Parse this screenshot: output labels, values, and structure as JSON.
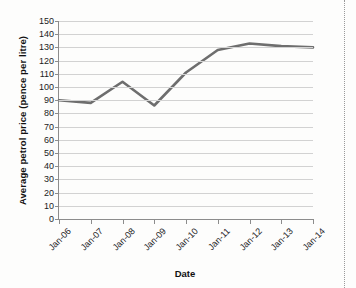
{
  "page": {
    "background_color": "#fdfdfc",
    "fold_marker": "dotted-vertical-rule"
  },
  "chart_data": {
    "type": "line",
    "title": "",
    "subtitle": "",
    "xlabel": "Date",
    "ylabel": "Average petrol price (pence per litre)",
    "categories": [
      "Jan-06",
      "Jan-07",
      "Jan-08",
      "Jan-09",
      "Jan-10",
      "Jan-11",
      "Jan-12",
      "Jan-13",
      "Jan-14"
    ],
    "values": [
      90,
      88,
      104,
      86,
      111,
      128,
      133,
      131,
      130
    ],
    "series": [
      {
        "name": "Average petrol price",
        "values": [
          90,
          88,
          104,
          86,
          111,
          128,
          133,
          131,
          130
        ],
        "color": "#6e6e6e",
        "line_width": 2.6,
        "markers": false
      }
    ],
    "ylim": [
      0,
      150
    ],
    "ytick_step": 10,
    "ytick_labels": [
      "0",
      "10",
      "20",
      "30",
      "40",
      "50",
      "60",
      "70",
      "80",
      "90",
      "100",
      "110",
      "120",
      "130",
      "140",
      "150"
    ],
    "xtick_labels": [
      "Jan-06",
      "Jan-07",
      "Jan-08",
      "Jan-09",
      "Jan-10",
      "Jan-11",
      "Jan-12",
      "Jan-13",
      "Jan-14"
    ],
    "xtick_label_rotation": -45,
    "grid": {
      "horizontal": true,
      "vertical": false,
      "color": "#d2d2d2"
    },
    "legend": {
      "visible": false,
      "position": "none",
      "entries": []
    },
    "axis_color": "#8c8c8c",
    "plot_background": "#ffffff"
  }
}
